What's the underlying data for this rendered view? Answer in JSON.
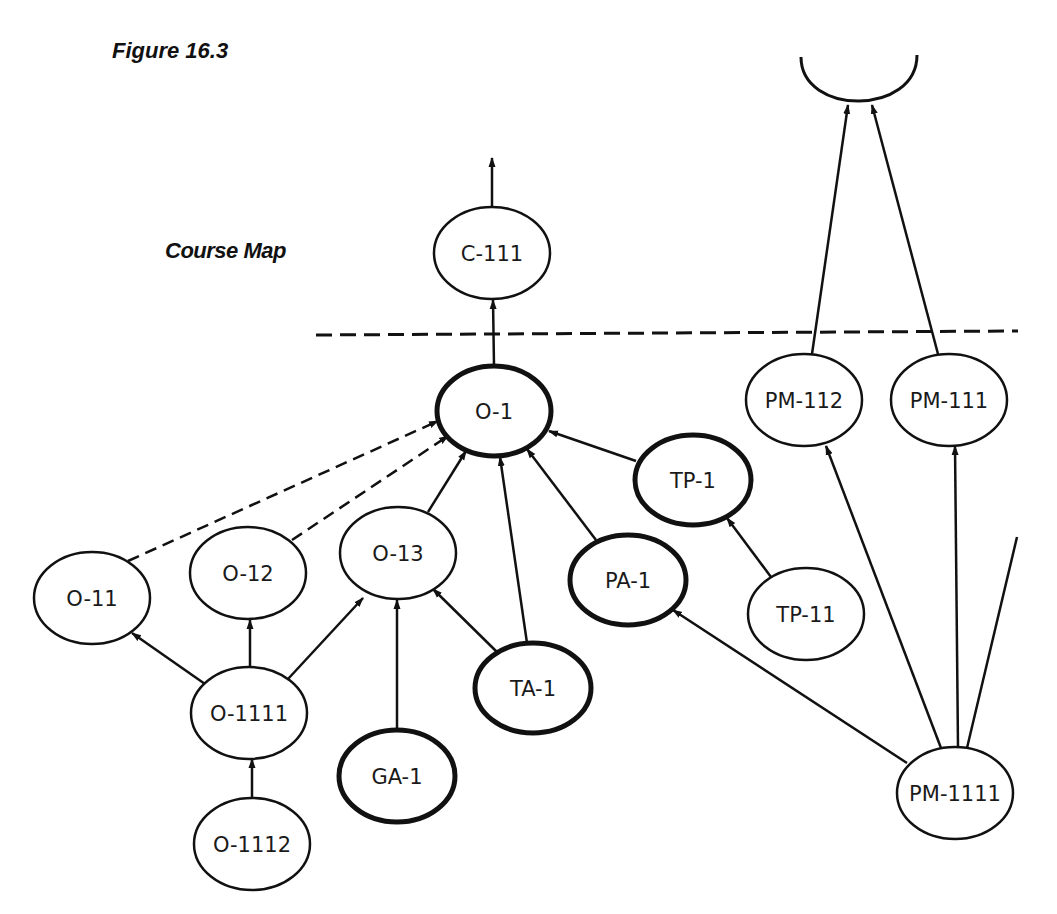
{
  "figure_title": "Figure 16.3",
  "map_title": "Course Map",
  "colors": {
    "ink": "#111111",
    "background": "#ffffff"
  },
  "nodes": [
    {
      "id": "C-111",
      "label": "C-111",
      "cx": 492,
      "cy": 253,
      "rx": 58,
      "ry": 46,
      "bold": false
    },
    {
      "id": "O-1",
      "label": "O-1",
      "cx": 494,
      "cy": 411,
      "rx": 57,
      "ry": 45,
      "bold": true
    },
    {
      "id": "O-11",
      "label": "O-11",
      "cx": 92,
      "cy": 598,
      "rx": 58,
      "ry": 46,
      "bold": false
    },
    {
      "id": "O-12",
      "label": "O-12",
      "cx": 248,
      "cy": 573,
      "rx": 58,
      "ry": 46,
      "bold": false
    },
    {
      "id": "O-13",
      "label": "O-13",
      "cx": 398,
      "cy": 553,
      "rx": 58,
      "ry": 46,
      "bold": false
    },
    {
      "id": "O-1111",
      "label": "O-1111",
      "cx": 249,
      "cy": 713,
      "rx": 58,
      "ry": 46,
      "bold": false
    },
    {
      "id": "O-1112",
      "label": "O-1112",
      "cx": 252,
      "cy": 844,
      "rx": 58,
      "ry": 46,
      "bold": false
    },
    {
      "id": "GA-1",
      "label": "GA-1",
      "cx": 397,
      "cy": 776,
      "rx": 58,
      "ry": 46,
      "bold": true
    },
    {
      "id": "TA-1",
      "label": "TA-1",
      "cx": 533,
      "cy": 688,
      "rx": 58,
      "ry": 45,
      "bold": true
    },
    {
      "id": "PA-1",
      "label": "PA-1",
      "cx": 628,
      "cy": 580,
      "rx": 58,
      "ry": 45,
      "bold": true
    },
    {
      "id": "TP-1",
      "label": "TP-1",
      "cx": 693,
      "cy": 480,
      "rx": 58,
      "ry": 45,
      "bold": true
    },
    {
      "id": "TP-11",
      "label": "TP-11",
      "cx": 806,
      "cy": 614,
      "rx": 58,
      "ry": 46,
      "bold": false
    },
    {
      "id": "PM-112",
      "label": "PM-112",
      "cx": 804,
      "cy": 400,
      "rx": 58,
      "ry": 46,
      "bold": false
    },
    {
      "id": "PM-111",
      "label": "PM-111",
      "cx": 949,
      "cy": 400,
      "rx": 58,
      "ry": 46,
      "bold": false
    },
    {
      "id": "PM-1111",
      "label": "PM-1111",
      "cx": 955,
      "cy": 793,
      "rx": 58,
      "ry": 46,
      "bold": false
    }
  ],
  "edges": [
    {
      "from": "C-111",
      "to": "up-arrow",
      "x1": 492,
      "y1": 207,
      "x2": 492,
      "y2": 158,
      "dashed": false,
      "arrow": true
    },
    {
      "from": "O-1",
      "to": "C-111",
      "x1": 494,
      "y1": 366,
      "x2": 493,
      "y2": 300,
      "dashed": false,
      "arrow": true
    },
    {
      "from": "O-11",
      "to": "O-1",
      "x1": 128,
      "y1": 561,
      "x2": 438,
      "y2": 421,
      "dashed": true,
      "arrow": true
    },
    {
      "from": "O-12",
      "to": "O-1",
      "x1": 292,
      "y1": 540,
      "x2": 448,
      "y2": 436,
      "dashed": true,
      "arrow": true
    },
    {
      "from": "O-13",
      "to": "O-1",
      "x1": 428,
      "y1": 512,
      "x2": 466,
      "y2": 451,
      "dashed": false,
      "arrow": true
    },
    {
      "from": "TA-1",
      "to": "O-1",
      "x1": 527,
      "y1": 643,
      "x2": 500,
      "y2": 457,
      "dashed": false,
      "arrow": true
    },
    {
      "from": "PA-1",
      "to": "O-1",
      "x1": 596,
      "y1": 540,
      "x2": 527,
      "y2": 449,
      "dashed": false,
      "arrow": true
    },
    {
      "from": "TP-1",
      "to": "O-1",
      "x1": 636,
      "y1": 461,
      "x2": 549,
      "y2": 431,
      "dashed": false,
      "arrow": true
    },
    {
      "from": "O-1111",
      "to": "O-11",
      "x1": 205,
      "y1": 684,
      "x2": 132,
      "y2": 633,
      "dashed": false,
      "arrow": true
    },
    {
      "from": "O-1111",
      "to": "O-12",
      "x1": 250,
      "y1": 667,
      "x2": 250,
      "y2": 620,
      "dashed": false,
      "arrow": true
    },
    {
      "from": "O-1111",
      "to": "O-13",
      "x1": 288,
      "y1": 679,
      "x2": 363,
      "y2": 598,
      "dashed": false,
      "arrow": true
    },
    {
      "from": "O-1112",
      "to": "O-1111",
      "x1": 252,
      "y1": 798,
      "x2": 252,
      "y2": 759,
      "dashed": false,
      "arrow": true
    },
    {
      "from": "GA-1",
      "to": "O-13",
      "x1": 397,
      "y1": 730,
      "x2": 397,
      "y2": 600,
      "dashed": false,
      "arrow": true
    },
    {
      "from": "TA-1",
      "to": "O-13",
      "x1": 497,
      "y1": 652,
      "x2": 433,
      "y2": 589,
      "dashed": false,
      "arrow": true
    },
    {
      "from": "TP-11",
      "to": "TP-1",
      "x1": 771,
      "y1": 577,
      "x2": 727,
      "y2": 518,
      "dashed": false,
      "arrow": true
    },
    {
      "from": "PM-1111",
      "to": "PA-1",
      "x1": 907,
      "y1": 763,
      "x2": 673,
      "y2": 610,
      "dashed": false,
      "arrow": true
    },
    {
      "from": "PM-1111",
      "to": "PM-112",
      "x1": 941,
      "y1": 748,
      "x2": 826,
      "y2": 446,
      "dashed": false,
      "arrow": true
    },
    {
      "from": "PM-1111",
      "to": "PM-111",
      "x1": 958,
      "y1": 747,
      "x2": 955,
      "y2": 446,
      "dashed": false,
      "arrow": true
    },
    {
      "from": "PM-1111",
      "to": "off-map",
      "x1": 967,
      "y1": 748,
      "x2": 1017,
      "y2": 537,
      "dashed": false,
      "arrow": false
    },
    {
      "from": "PM-112",
      "to": "goal-cup",
      "x1": 812,
      "y1": 354,
      "x2": 848,
      "y2": 105,
      "dashed": false,
      "arrow": true
    },
    {
      "from": "PM-111",
      "to": "goal-cup",
      "x1": 938,
      "y1": 354,
      "x2": 872,
      "y2": 105,
      "dashed": false,
      "arrow": true
    }
  ],
  "boundary_line": {
    "x1": 316,
    "y1": 335,
    "x2": 1018,
    "y2": 331,
    "dashed": true
  },
  "goal_cup": {
    "x1": 801,
    "y1": 57,
    "x2": 917,
    "y2": 55,
    "bottom_y": 104
  }
}
